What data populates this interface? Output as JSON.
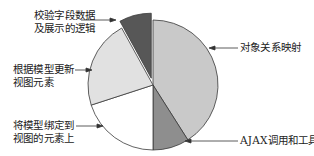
{
  "chart_data": {
    "type": "pie",
    "title": "",
    "exploded_slice": "校验字段数据及展示的逻辑",
    "start_angle_deg": 0,
    "direction": "clockwise",
    "categories": [
      "对象关系映射",
      "AJAX调用和工具库",
      "将模型绑定到视图的元素上",
      "根据模型更新视图元素",
      "校验字段数据及展示的逻辑"
    ],
    "values": [
      41,
      9,
      20,
      22,
      8
    ],
    "colors": [
      "#c9c9c9",
      "#8e8e8e",
      "#ffffff",
      "#e1e1e1",
      "#575757"
    ],
    "legend": "none (callout labels with arrows)"
  },
  "labels": {
    "orm": "对象关系映射",
    "ajax": "AJAX调用和工具库",
    "bind_line1": "将模型绑定到",
    "bind_line2": "视图的元素上",
    "update_line1": "根据模型更新",
    "update_line2": "视图元素",
    "validate_line1": "校验字段数据",
    "validate_line2": "及展示的逻辑"
  }
}
